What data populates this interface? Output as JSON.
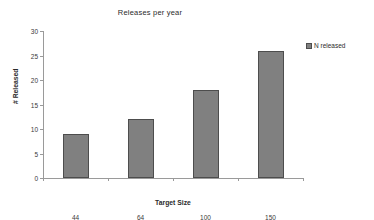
{
  "chart_data": {
    "type": "bar",
    "title": "Releases per year",
    "xlabel": "Target Size",
    "ylabel": "# Released",
    "categories": [
      "44",
      "64",
      "100",
      "150"
    ],
    "values": [
      9,
      12,
      18,
      26
    ],
    "series": [
      {
        "name": "N released",
        "values": [
          9,
          12,
          18,
          26
        ]
      }
    ],
    "ylim": [
      0,
      30
    ],
    "ytick_step": 5,
    "yticks": [
      0,
      5,
      10,
      15,
      20,
      25,
      30
    ],
    "ytick_labels": [
      "0",
      "5",
      "10",
      "15",
      "20",
      "25",
      "30"
    ],
    "grid": false,
    "legend": {
      "position": "right",
      "entries": [
        "N released"
      ]
    },
    "colors": {
      "bar_fill": "#808080",
      "bar_border": "#4d4d4d",
      "axis": "#9a9a9a",
      "text": "#2b2b2b",
      "background": "#ffffff"
    }
  }
}
